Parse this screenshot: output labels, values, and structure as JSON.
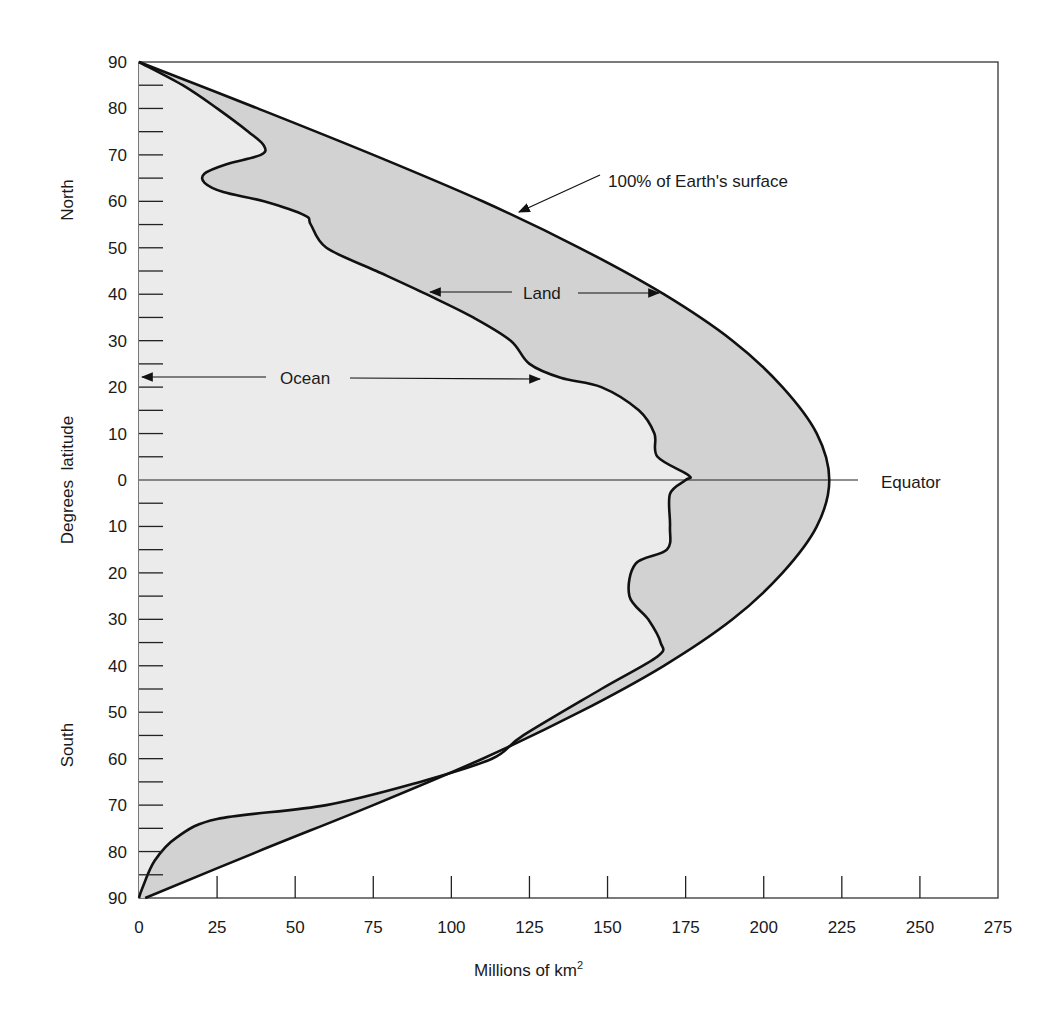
{
  "chart_data": {
    "type": "area",
    "orientation": "horizontal",
    "title": "",
    "xlabel": "Millions of km",
    "xlabel_superscript": "2",
    "ylabel": "Degrees  latitude",
    "ylabel_north": "North",
    "ylabel_south": "South",
    "xlim": [
      0,
      275
    ],
    "ylim": [
      -90,
      90
    ],
    "x_ticks": [
      0,
      25,
      50,
      75,
      100,
      125,
      150,
      175,
      200,
      225,
      250,
      275
    ],
    "y_tick_labels": [
      "90",
      "80",
      "70",
      "60",
      "50",
      "40",
      "30",
      "20",
      "10",
      "0",
      "10",
      "20",
      "30",
      "40",
      "50",
      "60",
      "70",
      "80",
      "90"
    ],
    "y_tick_values": [
      90,
      80,
      70,
      60,
      50,
      40,
      30,
      20,
      10,
      0,
      -10,
      -20,
      -30,
      -40,
      -50,
      -60,
      -70,
      -80,
      -90
    ],
    "grid": false,
    "legend": null,
    "colors": {
      "ocean_fill": "#ebebeb",
      "land_fill": "#d2d2d2",
      "line": "#111111",
      "background": "#ffffff"
    },
    "series": [
      {
        "name": "100% of Earth's surface",
        "latitude": [
          90,
          80,
          70,
          60,
          50,
          40,
          30,
          20,
          10,
          0,
          -10,
          -20,
          -30,
          -40,
          -50,
          -60,
          -70,
          -80,
          -90
        ],
        "values": [
          0,
          38,
          75,
          110,
          141,
          168,
          190,
          206,
          217,
          221,
          217,
          206,
          190,
          168,
          141,
          110,
          75,
          38,
          2
        ]
      },
      {
        "name": "Ocean",
        "latitude": [
          90,
          85,
          80,
          75,
          72,
          70,
          68,
          66,
          64,
          62,
          60,
          57,
          55,
          50,
          45,
          40,
          35,
          30,
          25,
          22,
          20,
          15,
          10,
          5,
          1,
          0,
          -3,
          -10,
          -15,
          -18,
          -25,
          -30,
          -35,
          -38,
          -45,
          -55,
          -60,
          -65,
          -70,
          -73,
          -77,
          -82,
          -88,
          -90
        ],
        "values": [
          0,
          14,
          25,
          35,
          40,
          39,
          28,
          21,
          21,
          27,
          40,
          53,
          55,
          60,
          76,
          92,
          107,
          119,
          125,
          135,
          148,
          160,
          165,
          166,
          176,
          175,
          170,
          170,
          169,
          159,
          157,
          163,
          167,
          166,
          148,
          123,
          113,
          90,
          60,
          25,
          12,
          5,
          1,
          0
        ]
      }
    ],
    "annotations": [
      {
        "text": "100% of Earth's surface",
        "arrow_to": [
          122,
          58
        ]
      },
      {
        "text": "Land",
        "arrows_to": [
          [
            92,
            40
          ],
          [
            166,
            40
          ]
        ]
      },
      {
        "text": "Ocean",
        "arrows_to": [
          [
            0,
            22
          ],
          [
            128,
            22
          ]
        ]
      },
      {
        "text": "Equator",
        "at_latitude": 0
      }
    ]
  },
  "labels": {
    "equator": "Equator",
    "land": "Land",
    "ocean": "Ocean",
    "surface": "100% of Earth's surface",
    "north": "North",
    "south": "South",
    "ylabel": "Degrees  latitude",
    "xlabel": "Millions of km",
    "xlabel_sup": "2"
  }
}
